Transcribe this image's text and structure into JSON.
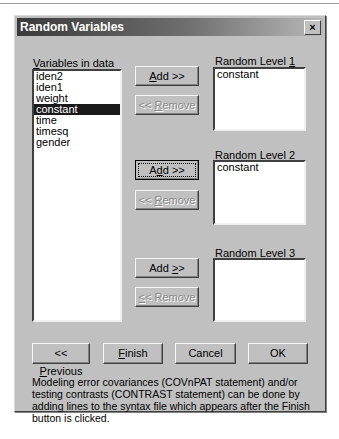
{
  "window": {
    "title": "Random Variables",
    "close_label": "×"
  },
  "variables": {
    "label": "Variables in data",
    "label_accel": "V",
    "items": [
      "iden2",
      "iden1",
      "weight",
      "constant",
      "time",
      "timesq",
      "gender"
    ],
    "selected": "constant"
  },
  "levels": [
    {
      "label": "Random Level 1",
      "label_prefix": "Random Level ",
      "accel": "1",
      "items": [
        "constant"
      ],
      "add": "Add >>",
      "remove": "<< Remove"
    },
    {
      "label": "Random Level 2",
      "label_prefix": "Random Level ",
      "accel": "2",
      "items": [
        "constant"
      ],
      "add": "Add >>",
      "remove": "<< Remove"
    },
    {
      "label": "Random Level 3",
      "label_prefix": "Random Level ",
      "accel": "3",
      "items": [],
      "add": "Add >>",
      "remove": "<< Remove"
    }
  ],
  "footer": {
    "previous": "<< Previous",
    "finish": "Finish",
    "cancel": "Cancel",
    "ok": "OK",
    "note": "Modeling error covariances (COVnPAT statement) and/or testing contrasts (CONTRAST statement) can be done by adding lines to the syntax file which appears after the Finish button is clicked."
  }
}
